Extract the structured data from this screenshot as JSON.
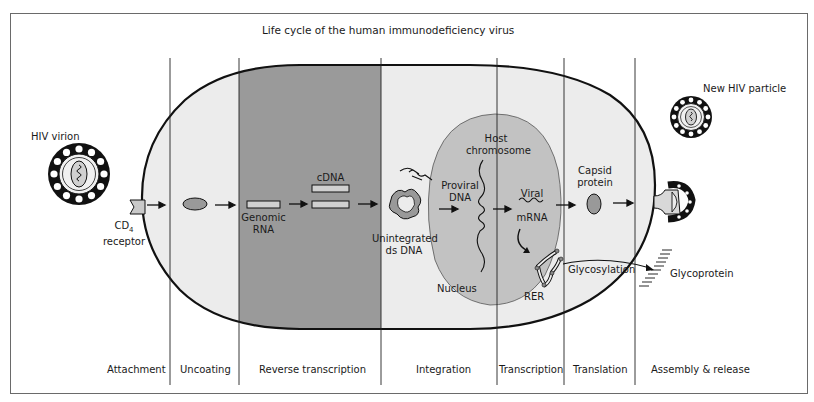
{
  "title": "Life cycle of the human immunodeficiency virus",
  "colors": {
    "cell_fill": "#ececec",
    "nucleus_fill": "#c2c2c2",
    "reverse_transcription_fill": "#9a9a9a",
    "outline": "#111111",
    "frame": "#6a6a6a"
  },
  "labels": {
    "hiv_virion": "HIV virion",
    "cd4": "CD",
    "cd4_sub": "4",
    "receptor": "receptor",
    "genomic_rna_1": "Genomic",
    "genomic_rna_2": "RNA",
    "cdna": "cDNA",
    "unintegrated_1": "Unintegrated",
    "unintegrated_2": "ds DNA",
    "host_chromosome_1": "Host",
    "host_chromosome_2": "chromosome",
    "proviral_1": "Proviral",
    "proviral_2": "DNA",
    "nucleus": "Nucleus",
    "viral_mrna_1": "Viral",
    "viral_mrna_2": "mRNA",
    "rer": "RER",
    "capsid_1": "Capsid",
    "capsid_2": "protein",
    "glycosylation": "Glycosylation",
    "glycoprotein": "Glycoprotein",
    "new_hiv_particle": "New HIV particle"
  },
  "stages": [
    {
      "label": "Attachment"
    },
    {
      "label": "Uncoating"
    },
    {
      "label": "Reverse transcription"
    },
    {
      "label": "Integration"
    },
    {
      "label": "Transcription"
    },
    {
      "label": "Translation"
    },
    {
      "label": "Assembly & release"
    }
  ]
}
